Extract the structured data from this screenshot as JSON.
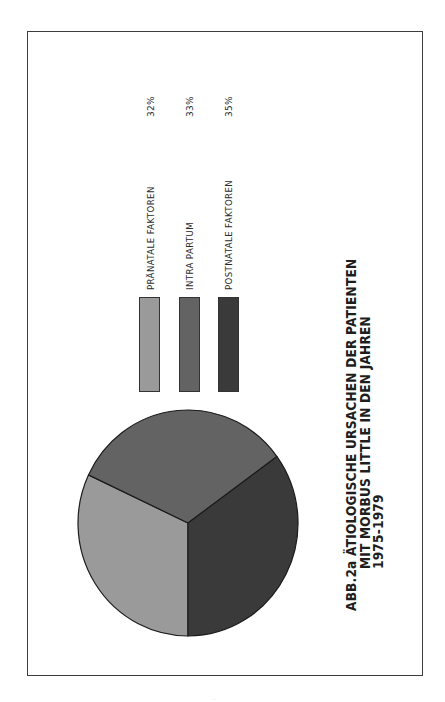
{
  "figure": {
    "title_lines": [
      "ABB.2a ÄTIOLOGISCHE URSACHEN DER PATIENTEN",
      "MIT MORBUS LITTLE IN DEN JAHREN",
      "1975-1979"
    ],
    "orientation": "rotated 90deg counter-clockwise"
  },
  "legend": {
    "items": [
      {
        "label": "PRÄNATALE FAKTOREN",
        "value": "32%",
        "color": "#9a9a9a"
      },
      {
        "label": "INTRA  PARTUM",
        "value": "33%",
        "color": "#636363"
      },
      {
        "label": "POSTNATALE  FAKTOREN",
        "value": "35%",
        "color": "#3a3a3a"
      }
    ]
  },
  "chart_data": {
    "type": "pie",
    "categories": [
      "PRÄNATALE FAKTOREN",
      "INTRA PARTUM",
      "POSTNATALE FAKTOREN"
    ],
    "values": [
      32,
      33,
      35
    ],
    "unit": "%",
    "colors": [
      "#9a9a9a",
      "#636363",
      "#3a3a3a"
    ],
    "legend_position": "right of pie (rotated layout)",
    "xlabel": "",
    "ylabel": ""
  }
}
